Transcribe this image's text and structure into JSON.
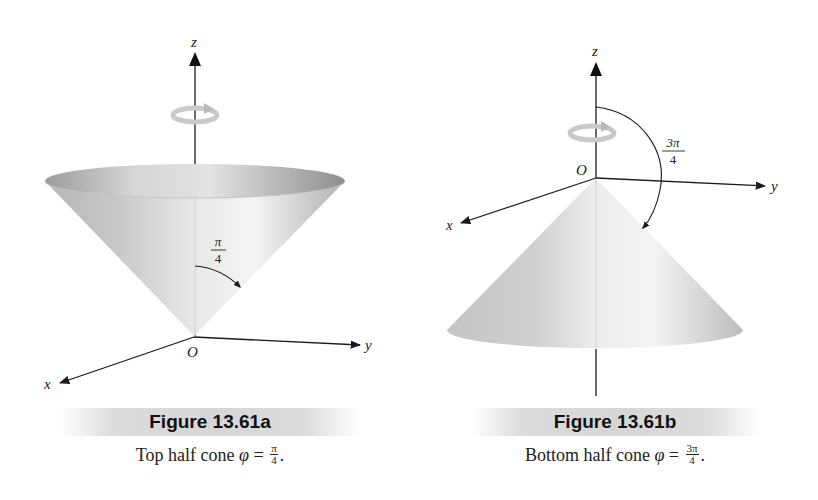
{
  "figures": [
    {
      "id": "a",
      "title": "Figure 13.61a",
      "caption": {
        "prefix": "Top half cone ",
        "symbol": "φ",
        "equals": " = ",
        "frac_num": "π",
        "frac_den": "4",
        "suffix": "."
      },
      "axes": {
        "z": "z",
        "y": "y",
        "x": "x",
        "origin": "O"
      },
      "angle_label": {
        "num": "π",
        "den": "4"
      },
      "orientation": "top"
    },
    {
      "id": "b",
      "title": "Figure 13.61b",
      "caption": {
        "prefix": "Bottom half cone ",
        "symbol": "φ",
        "equals": " = ",
        "frac_num": "3π",
        "frac_den": "4",
        "suffix": "."
      },
      "axes": {
        "z": "z",
        "y": "y",
        "x": "x",
        "origin": "O"
      },
      "angle_label": {
        "num": "3π",
        "den": "4"
      },
      "orientation": "bottom"
    }
  ],
  "colors": {
    "axis": "#1a1a1a",
    "cone_light": "#f2f2f2",
    "cone_mid": "#cfcfcf",
    "cone_dark": "#9a9a9a",
    "rotation_icon": "#c8c8c8",
    "caption_band": "#d8d8d8"
  }
}
